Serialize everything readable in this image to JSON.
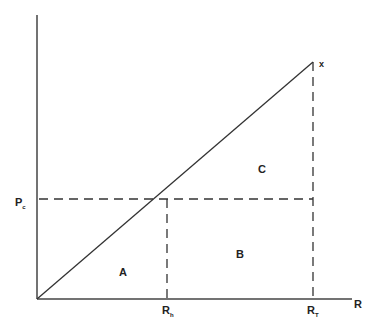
{
  "diagram": {
    "axes": {
      "x_label": "R",
      "y_label": ""
    },
    "ticks": {
      "y_tick": {
        "main": "P",
        "sub": "c"
      },
      "x_tick_1": {
        "main": "R",
        "sub": "h"
      },
      "x_tick_2": {
        "main": "R",
        "sub": "T"
      }
    },
    "line_end_label": "x",
    "regions": {
      "a": "A",
      "b": "B",
      "c": "C"
    },
    "colors": {
      "line": "#333333",
      "dash": "#333333",
      "text": "#222222"
    }
  }
}
